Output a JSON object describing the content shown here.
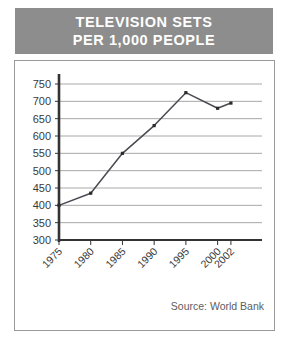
{
  "banner": {
    "title_line1": "TELEVISION SETS",
    "title_line2": "PER 1,000 PEOPLE",
    "background_color": "#8d8d8d",
    "text_color": "#ffffff"
  },
  "source_note": "Source: World Bank",
  "chart_data": {
    "type": "line",
    "title": "TELEVISION SETS PER 1,000 PEOPLE",
    "subtitle": "",
    "xlabel": "",
    "ylabel": "",
    "categories": [
      "1975",
      "1980",
      "1985",
      "1990",
      "1995",
      "2000",
      "2002"
    ],
    "x": [
      1975,
      1980,
      1985,
      1990,
      1995,
      2000,
      2002
    ],
    "values": [
      400,
      435,
      550,
      630,
      725,
      680,
      695
    ],
    "series": [
      {
        "name": "Television sets per 1,000 people",
        "values": [
          400,
          435,
          550,
          630,
          725,
          680,
          695
        ]
      }
    ],
    "ylim": [
      300,
      750
    ],
    "xlim": [
      1975,
      2002
    ],
    "yticks": [
      300,
      350,
      400,
      450,
      500,
      550,
      600,
      650,
      700,
      750
    ],
    "ytick_labels": [
      "300",
      "350",
      "400",
      "450",
      "500",
      "550",
      "600",
      "650",
      "700",
      "750"
    ],
    "xtick_labels": [
      "1975",
      "1980",
      "1985",
      "1990",
      "1995",
      "2000",
      "2002"
    ],
    "xtick_rotation": 45,
    "grid": "horizontal",
    "gridline_color": "#a8a8a8",
    "axis_color": "#333333",
    "line_color": "#4a4a52",
    "marker_color": "#2b2b2b",
    "marker_shape": "square",
    "legend": "none",
    "annotations": [
      "Source: World Bank"
    ]
  }
}
